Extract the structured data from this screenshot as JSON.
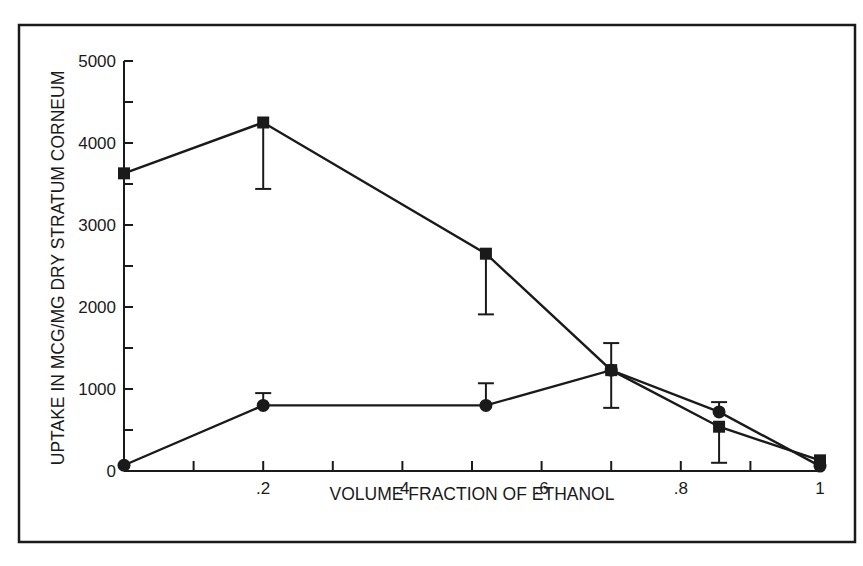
{
  "chart_data": {
    "type": "line",
    "title": "",
    "xlabel": "VOLUME FRACTION OF ETHANOL",
    "ylabel": "UPTAKE IN MCG/MG DRY STRATUM CORNEUM",
    "xlim": [
      0,
      1
    ],
    "ylim": [
      0,
      5000
    ],
    "x_ticks": [
      0.1,
      0.2,
      0.3,
      0.4,
      0.5,
      0.6,
      0.7,
      0.8,
      0.9,
      1.0
    ],
    "x_tick_labels": [
      {
        "value": 0.2,
        "label": ".2"
      },
      {
        "value": 0.4,
        "label": ".4"
      },
      {
        "value": 0.6,
        "label": ".6"
      },
      {
        "value": 0.8,
        "label": ".8"
      },
      {
        "value": 1.0,
        "label": "1"
      }
    ],
    "y_ticks": [
      0,
      500,
      1000,
      1500,
      2000,
      2500,
      3000,
      3500,
      4000,
      4500,
      5000
    ],
    "y_tick_labels": [
      {
        "value": 0,
        "label": "0"
      },
      {
        "value": 1000,
        "label": "1000"
      },
      {
        "value": 2000,
        "label": "2000"
      },
      {
        "value": 3000,
        "label": "3000"
      },
      {
        "value": 4000,
        "label": "4000"
      },
      {
        "value": 5000,
        "label": "5000"
      }
    ],
    "grid": false,
    "legend": null,
    "series": [
      {
        "name": "square markers",
        "marker": "square",
        "x": [
          0.0,
          0.2,
          0.52,
          0.7,
          0.855,
          1.0
        ],
        "values": [
          3630,
          4250,
          2650,
          1230,
          540,
          130
        ],
        "error_bars": [
          {
            "x": 0.2,
            "low": 3440
          },
          {
            "x": 0.52,
            "low": 1910
          },
          {
            "x": 0.855,
            "low": 100
          }
        ]
      },
      {
        "name": "circle markers",
        "marker": "circle",
        "x": [
          0.0,
          0.2,
          0.52,
          0.7,
          0.855,
          1.0
        ],
        "values": [
          70,
          800,
          800,
          1230,
          720,
          60
        ],
        "error_bars": [
          {
            "x": 0.2,
            "high": 950
          },
          {
            "x": 0.52,
            "high": 1070
          },
          {
            "x": 0.7,
            "high": 1560,
            "low": 770
          },
          {
            "x": 0.855,
            "high": 840
          }
        ]
      }
    ]
  }
}
